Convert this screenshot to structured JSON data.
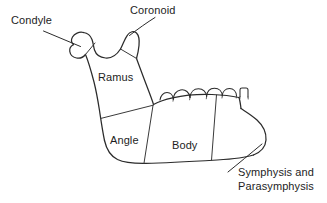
{
  "figure": {
    "background_color": "#ffffff",
    "stroke_color": "#2b2b2b",
    "text_color": "#1d1d1d"
  },
  "labels": {
    "condyle": "Condyle",
    "coronoid": "Coronoid",
    "ramus": "Ramus",
    "angle": "Angle",
    "body": "Body",
    "symphysis_line1": "Symphysis and",
    "symphysis_line2": "Parasymphysis"
  },
  "regions": [
    {
      "name": "condyle",
      "label": "Condyle",
      "callout": true
    },
    {
      "name": "coronoid",
      "label": "Coronoid",
      "callout": true
    },
    {
      "name": "ramus",
      "label": "Ramus",
      "callout": false
    },
    {
      "name": "angle",
      "label": "Angle",
      "callout": false
    },
    {
      "name": "body",
      "label": "Body",
      "callout": false
    },
    {
      "name": "symphysis-parasymphysis",
      "label": "Symphysis and Parasymphysis",
      "callout": true
    }
  ],
  "teeth": {
    "count": 6,
    "description": "molar and premolar crowns along the superior alveolar border"
  }
}
